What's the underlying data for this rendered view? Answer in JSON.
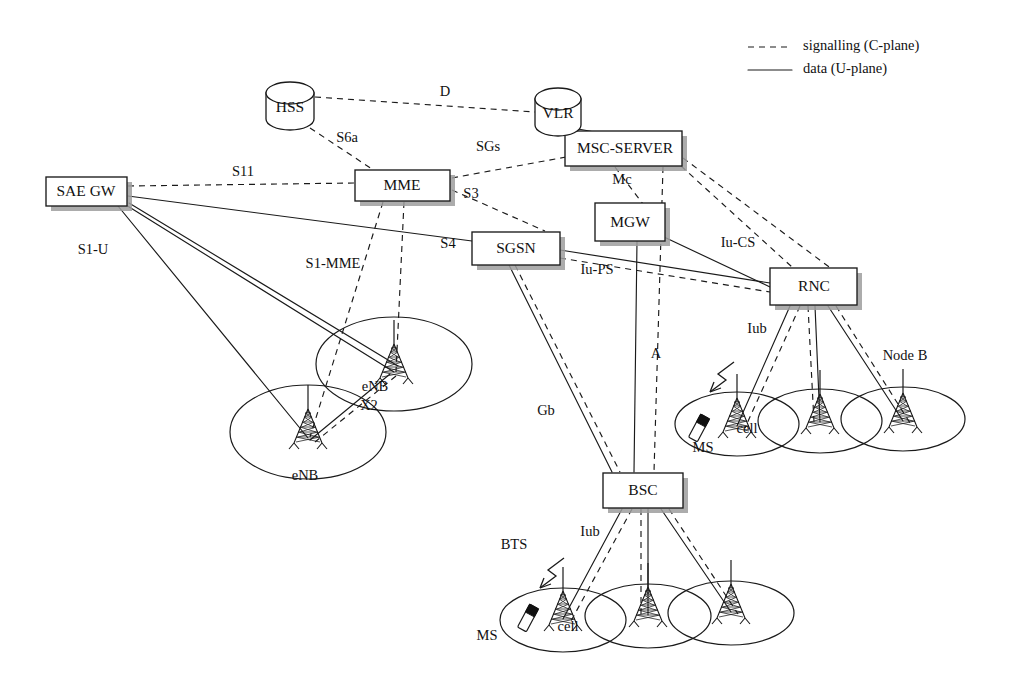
{
  "diagram": {
    "background_color": "#ffffff",
    "line_color": "#1a1a1a",
    "shadow_color": "#9e9e9e"
  },
  "legend": {
    "items": [
      {
        "label": "signalling (C-plane)",
        "style": "dashed"
      },
      {
        "label": "data (U-plane)",
        "style": "solid"
      }
    ]
  },
  "nodes": {
    "sae_gw": {
      "label": "SAE GW",
      "shape": "box",
      "x": 46,
      "y": 177,
      "w": 81,
      "h": 29
    },
    "mme": {
      "label": "MME",
      "shape": "box",
      "x": 355,
      "y": 170,
      "w": 95,
      "h": 31
    },
    "sgsn": {
      "label": "SGSN",
      "shape": "box",
      "x": 472,
      "y": 232,
      "w": 88,
      "h": 33
    },
    "mgw": {
      "label": "MGW",
      "shape": "box",
      "x": 595,
      "y": 203,
      "w": 70,
      "h": 38
    },
    "msc_server": {
      "label": "MSC-SERVER",
      "shape": "box",
      "x": 565,
      "y": 131,
      "w": 117,
      "h": 35
    },
    "rnc": {
      "label": "RNC",
      "shape": "box",
      "x": 770,
      "y": 268,
      "w": 87,
      "h": 37
    },
    "bsc": {
      "label": "BSC",
      "shape": "box",
      "x": 603,
      "y": 473,
      "w": 80,
      "h": 35
    },
    "hss": {
      "label": "HSS",
      "shape": "cylinder",
      "x": 266,
      "y": 82,
      "w": 48,
      "h": 48
    },
    "vlr": {
      "label": "VLR",
      "shape": "cylinder",
      "x": 535,
      "y": 88,
      "w": 46,
      "h": 48
    }
  },
  "interfaces": [
    {
      "name": "D",
      "x": 445,
      "y": 93,
      "type": "signalling"
    },
    {
      "name": "S6a",
      "x": 347,
      "y": 139,
      "type": "signalling"
    },
    {
      "name": "S11",
      "x": 243,
      "y": 173,
      "type": "signalling"
    },
    {
      "name": "SGs",
      "x": 488,
      "y": 148,
      "type": "signalling"
    },
    {
      "name": "S3",
      "x": 471,
      "y": 195,
      "type": "signalling"
    },
    {
      "name": "Mc",
      "x": 622,
      "y": 181,
      "type": "signalling"
    },
    {
      "name": "S4",
      "x": 448,
      "y": 245,
      "type": "data"
    },
    {
      "name": "S1-U",
      "x": 93,
      "y": 251,
      "type": "data"
    },
    {
      "name": "S1-MME",
      "x": 333,
      "y": 265,
      "type": "signalling"
    },
    {
      "name": "Iu-PS",
      "x": 597,
      "y": 271,
      "type": "signalling"
    },
    {
      "name": "Iu-CS",
      "x": 738,
      "y": 244,
      "type": "data"
    },
    {
      "name": "X2",
      "x": 369,
      "y": 407,
      "type": "data"
    },
    {
      "name": "Iub",
      "x": 757,
      "y": 330,
      "type": "data"
    },
    {
      "name": "A",
      "x": 656,
      "y": 355,
      "type": "data"
    },
    {
      "name": "Gb",
      "x": 546,
      "y": 412,
      "type": "data"
    },
    {
      "name": "Iub",
      "x": 590,
      "y": 533,
      "type": "data"
    }
  ],
  "radio_labels": [
    {
      "name": "eNB",
      "x": 375,
      "y": 388
    },
    {
      "name": "eNB",
      "x": 305,
      "y": 477
    },
    {
      "name": "cell",
      "x": 747,
      "y": 430
    },
    {
      "name": "MS",
      "x": 703,
      "y": 449
    },
    {
      "name": "Node B",
      "x": 905,
      "y": 357
    },
    {
      "name": "BTS",
      "x": 514,
      "y": 546
    },
    {
      "name": "cell",
      "x": 568,
      "y": 628
    },
    {
      "name": "MS",
      "x": 487,
      "y": 637
    }
  ],
  "cells": {
    "lte": [
      {
        "cx": 394,
        "cy": 364,
        "rx": 78,
        "ry": 47,
        "tower_x": 394,
        "tower_base_y": 378
      },
      {
        "cx": 308,
        "cy": 432,
        "rx": 78,
        "ry": 47,
        "tower_x": 308,
        "tower_base_y": 443
      }
    ],
    "umts": [
      {
        "cx": 737,
        "cy": 424,
        "rx": 62,
        "ry": 32,
        "tower_x": 737,
        "tower_base_y": 432
      },
      {
        "cx": 820,
        "cy": 421,
        "rx": 62,
        "ry": 32,
        "tower_x": 820,
        "tower_base_y": 428
      },
      {
        "cx": 903,
        "cy": 419,
        "rx": 62,
        "ry": 32,
        "tower_x": 903,
        "tower_base_y": 427
      }
    ],
    "gsm": [
      {
        "cx": 563,
        "cy": 620,
        "rx": 63,
        "ry": 32,
        "tower_x": 563,
        "tower_base_y": 625
      },
      {
        "cx": 648,
        "cy": 616,
        "rx": 63,
        "ry": 32,
        "tower_x": 648,
        "tower_base_y": 621
      },
      {
        "cx": 731,
        "cy": 613,
        "rx": 63,
        "ry": 32,
        "tower_x": 731,
        "tower_base_y": 618
      }
    ]
  }
}
